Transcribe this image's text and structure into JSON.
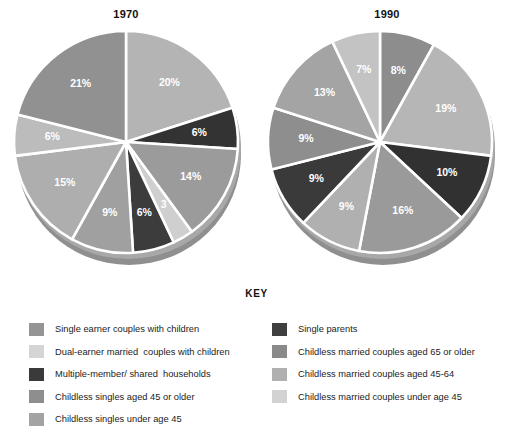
{
  "key": {
    "title": "KEY",
    "left_items": [
      {
        "label": "Single earner couples with children",
        "color": "#949494",
        "swatch_name": "legend-swatch-single-earner-couples"
      },
      {
        "label": "Dual-earner married  couples with children",
        "color": "#d5d5d5",
        "swatch_name": "legend-swatch-dual-earner-couples"
      },
      {
        "label": "Multiple-member/ shared  households",
        "color": "#3a3a3a",
        "swatch_name": "legend-swatch-multiple-member-households"
      },
      {
        "label": "Childless singles aged 45 or older",
        "color": "#8e8e8e",
        "swatch_name": "legend-swatch-childless-singles-45-older"
      },
      {
        "label": "Childless singles under age 45",
        "color": "#a3a3a3",
        "swatch_name": "legend-swatch-childless-singles-under-45"
      }
    ],
    "right_items": [
      {
        "label": "Single parents",
        "color": "#3f3f3f",
        "swatch_name": "legend-swatch-single-parents"
      },
      {
        "label": "Childless married couples aged 65 or older",
        "color": "#8a8a8a",
        "swatch_name": "legend-swatch-childless-married-65-older"
      },
      {
        "label": "Childless married couples aged 45-64",
        "color": "#b0b0b0",
        "swatch_name": "legend-swatch-childless-married-45-64"
      },
      {
        "label": "Childless married couples under age 45",
        "color": "#d2d2d2",
        "swatch_name": "legend-swatch-childless-married-under-45"
      }
    ]
  },
  "chart_data": [
    {
      "type": "pie",
      "title": "1970",
      "categories": [
        "Dual-earner married  couples with children",
        "Single parents",
        "Single earner couples with children",
        "Childless married couples under age 45",
        "Multiple-member/ shared  households",
        "Childless singles under age 45",
        "Childless married couples aged 45-64",
        "Childless married couples aged 65 or older",
        "Childless singles aged 45 or older"
      ],
      "values": [
        20,
        6,
        14,
        3,
        6,
        9,
        15,
        6,
        21
      ],
      "labels": [
        "20%",
        "6%",
        "14%",
        "3",
        "6%",
        "9%",
        "15%",
        "6%",
        "21%"
      ],
      "colors": [
        "#b4b4b4",
        "#333333",
        "#9b9b9b",
        "#cfcfcf",
        "#3c3c3c",
        "#a0a0a0",
        "#aeaeae",
        "#bcbcbc",
        "#919191"
      ],
      "legend_position": "bottom",
      "start_angle": -90,
      "direction": "clockwise"
    },
    {
      "type": "pie",
      "title": "1990",
      "categories": [
        "Single earner couples with children",
        "Dual-earner married  couples with children",
        "Single parents",
        "Childless married couples under age 45",
        "Childless singles under age 45",
        "Multiple-member/ shared  households",
        "Childless married couples aged 45-64",
        "Childless married couples aged 65 or older",
        "Childless singles aged 45 or older"
      ],
      "values": [
        8,
        19,
        10,
        16,
        9,
        9,
        9,
        13,
        7
      ],
      "labels": [
        "8%",
        "19%",
        "10%",
        "16%",
        "9%",
        "9%",
        "9%",
        "13%",
        "7%"
      ],
      "colors": [
        "#8d8d8d",
        "#b6b6b6",
        "#313131",
        "#9a9a9a",
        "#b0b0b0",
        "#3a3a3a",
        "#8e8e8e",
        "#a4a4a4",
        "#c3c3c3"
      ],
      "legend_position": "bottom",
      "start_angle": -90,
      "direction": "clockwise"
    }
  ]
}
